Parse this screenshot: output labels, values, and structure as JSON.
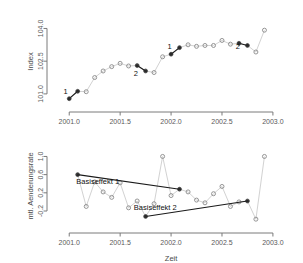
{
  "figure": {
    "background": "#ffffff",
    "point_color": "#8a8a8a",
    "line_color": "#d2d2d2",
    "trend_color": "#1a1a1a",
    "axis_color": "#7a7a7a"
  },
  "chart_data": [
    {
      "type": "line",
      "panel": "top",
      "title": "",
      "xlabel": "",
      "ylabel": "Index",
      "xlim": [
        2000.88,
        2003.05
      ],
      "ylim": [
        100.72,
        104.25
      ],
      "xticks": [
        2001.0,
        2001.5,
        2002.0,
        2002.5,
        2003.0
      ],
      "xticklabels": [
        "2001.0",
        "2001.5",
        "2002.0",
        "2002.5",
        "2003.0"
      ],
      "yticks": [
        101.0,
        102.5,
        104.0
      ],
      "yticklabels": [
        "101.0",
        "102.5",
        "104.0"
      ],
      "grid": false,
      "x": [
        2001.0,
        2001.083,
        2001.167,
        2001.25,
        2001.333,
        2001.417,
        2001.5,
        2001.583,
        2001.667,
        2001.75,
        2001.833,
        2001.917,
        2002.0,
        2002.083,
        2002.167,
        2002.25,
        2002.333,
        2002.417,
        2002.5,
        2002.583,
        2002.667,
        2002.75,
        2002.833,
        2002.917
      ],
      "values": [
        100.78,
        101.12,
        101.1,
        101.75,
        102.05,
        102.25,
        102.4,
        102.28,
        102.3,
        102.05,
        101.98,
        102.7,
        102.82,
        103.12,
        103.25,
        103.18,
        103.22,
        103.22,
        103.45,
        103.28,
        103.32,
        103.22,
        102.92,
        103.92
      ],
      "trend_segments": [
        {
          "label": "1",
          "x": [
            2001.0,
            2001.083
          ],
          "y": [
            100.78,
            101.12
          ],
          "label_x": 2000.965,
          "label_y": 101.1
        },
        {
          "label": "2",
          "x": [
            2001.667,
            2001.75
          ],
          "y": [
            102.3,
            102.05
          ],
          "label_x": 2001.655,
          "label_y": 101.92
        },
        {
          "label": "1",
          "x": [
            2002.0,
            2002.083
          ],
          "y": [
            102.82,
            103.12
          ],
          "label_x": 2001.985,
          "label_y": 103.17
        },
        {
          "label": "2",
          "x": [
            2002.667,
            2002.75
          ],
          "y": [
            103.32,
            103.22
          ],
          "label_x": 2002.655,
          "label_y": 103.13
        }
      ]
    },
    {
      "type": "line",
      "panel": "bottom",
      "title": "",
      "xlabel": "Zeit",
      "ylabel": "mtl. Aenderungsrate",
      "xlim": [
        2000.88,
        2003.05
      ],
      "ylim": [
        -0.42,
        1.12
      ],
      "xticks": [
        2001.0,
        2001.5,
        2002.0,
        2002.5,
        2003.0
      ],
      "xticklabels": [
        "2001.0",
        "2001.5",
        "2002.0",
        "2002.5",
        "2003.0"
      ],
      "yticks": [
        -0.2,
        0.2,
        0.6,
        1.0
      ],
      "yticklabels": [
        "-0.2",
        "0.2",
        "0.6",
        "1.0"
      ],
      "grid": false,
      "x": [
        2001.083,
        2001.167,
        2001.25,
        2001.333,
        2001.417,
        2001.5,
        2001.583,
        2001.667,
        2001.75,
        2001.833,
        2001.917,
        2002.0,
        2002.083,
        2002.167,
        2002.25,
        2002.333,
        2002.417,
        2002.5,
        2002.583,
        2002.667,
        2002.75,
        2002.833,
        2002.917
      ],
      "values": [
        0.6,
        -0.1,
        0.44,
        0.22,
        0.1,
        0.42,
        -0.13,
        0.02,
        -0.32,
        -0.04,
        1.0,
        0.14,
        0.28,
        0.22,
        0.04,
        -0.02,
        0.18,
        0.34,
        -0.1,
        0.0,
        0.02,
        -0.38,
        1.0
      ],
      "trend_segments": [
        {
          "label": "Basiseffekt 1",
          "x": [
            2001.083,
            2002.083
          ],
          "y": [
            0.6,
            0.28
          ],
          "label_x": 2001.28,
          "label_y": 0.43
        },
        {
          "label": "Basiseffekt 2",
          "x": [
            2001.75,
            2002.75
          ],
          "y": [
            -0.32,
            0.02
          ],
          "label_x": 2001.845,
          "label_y": -0.125
        }
      ]
    }
  ]
}
